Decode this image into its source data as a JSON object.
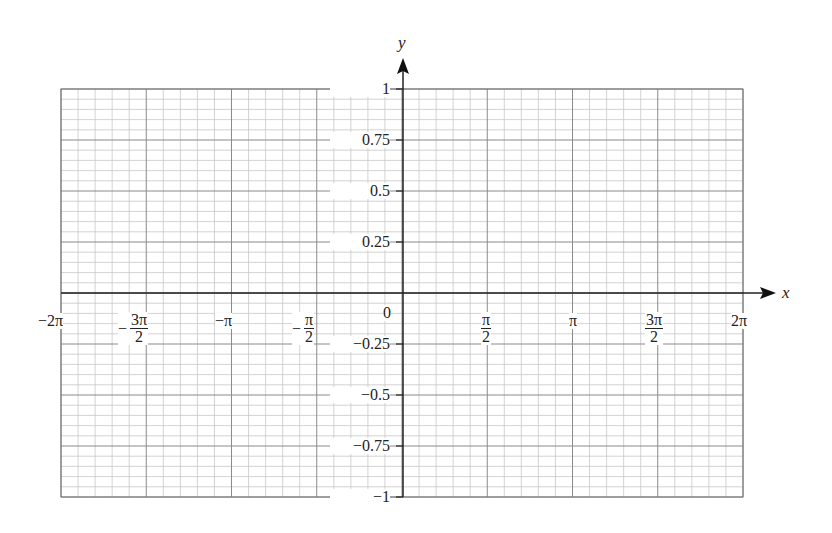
{
  "chart_data": {
    "type": "line",
    "title": "",
    "xlabel": "x",
    "ylabel": "y",
    "xlim": [
      -6.2832,
      6.2832
    ],
    "ylim": [
      -1,
      1
    ],
    "grid": true,
    "grid_minor_divisions": 5,
    "series": [],
    "x_ticks": [
      {
        "value": -6.2832,
        "label": "−2π"
      },
      {
        "value": -4.7124,
        "label_sign": "−",
        "num": "3π",
        "den": "2"
      },
      {
        "value": -3.1416,
        "label": "−π"
      },
      {
        "value": -1.5708,
        "label_sign": "−",
        "num": "π",
        "den": "2"
      },
      {
        "value": 0,
        "label": "0"
      },
      {
        "value": 1.5708,
        "num": "π",
        "den": "2"
      },
      {
        "value": 3.1416,
        "label": "π"
      },
      {
        "value": 4.7124,
        "num": "3π",
        "den": "2"
      },
      {
        "value": 6.2832,
        "label": "2π"
      }
    ],
    "y_ticks": [
      {
        "value": 1,
        "label": "1"
      },
      {
        "value": 0.75,
        "label": "0.75"
      },
      {
        "value": 0.5,
        "label": "0.5"
      },
      {
        "value": 0.25,
        "label": "0.25"
      },
      {
        "value": -0.25,
        "label": "−0.25"
      },
      {
        "value": -0.5,
        "label": "−0.5"
      },
      {
        "value": -0.75,
        "label": "−0.75"
      },
      {
        "value": -1,
        "label": "−1"
      }
    ]
  },
  "labels": {
    "x_axis": "x",
    "y_axis": "y",
    "origin": "0",
    "neg_2pi": "−2π",
    "neg_3pi_2_sign": "−",
    "neg_3pi_2_num": "3π",
    "neg_3pi_2_den": "2",
    "neg_pi": "−π",
    "neg_pi_2_sign": "−",
    "neg_pi_2_num": "π",
    "neg_pi_2_den": "2",
    "pi_2_num": "π",
    "pi_2_den": "2",
    "pi": "π",
    "three_pi_2_num": "3π",
    "three_pi_2_den": "2",
    "two_pi": "2π",
    "y1": "1",
    "y075": "0.75",
    "y05": "0.5",
    "y025": "0.25",
    "yn025": "−0.25",
    "yn05": "−0.5",
    "yn075": "−0.75",
    "yn1": "−1"
  }
}
